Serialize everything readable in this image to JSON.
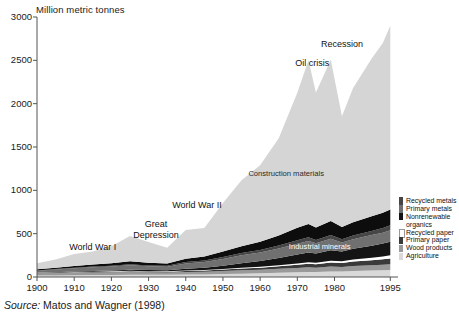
{
  "chart_data": {
    "type": "area",
    "title": "",
    "ylabel": "Million metric tonnes",
    "xlabel": "",
    "ylim": [
      0,
      3000
    ],
    "xlim": [
      1900,
      1996
    ],
    "yticks": [
      0,
      500,
      1000,
      1500,
      2000,
      2500,
      3000
    ],
    "xticks": [
      1900,
      1910,
      1920,
      1930,
      1940,
      1950,
      1960,
      1970,
      1980,
      1995
    ],
    "grid": false,
    "legend_position": "right",
    "stacked": true,
    "stack_order_bottom_to_top": [
      "Agriculture",
      "Wood products",
      "Primary paper",
      "Recycled paper",
      "Nonrenewable organics",
      "Primary metals",
      "Recycled metals",
      "Industrial minerals",
      "Construction materials"
    ],
    "x": [
      1900,
      1905,
      1910,
      1915,
      1920,
      1925,
      1930,
      1935,
      1940,
      1945,
      1950,
      1955,
      1960,
      1965,
      1970,
      1973,
      1975,
      1979,
      1982,
      1985,
      1990,
      1993,
      1995
    ],
    "series": [
      {
        "name": "Agriculture",
        "color": "#d9d9d9",
        "values": [
          16,
          18,
          20,
          22,
          24,
          26,
          26,
          26,
          28,
          30,
          34,
          38,
          42,
          48,
          54,
          58,
          58,
          64,
          64,
          68,
          74,
          78,
          82
        ]
      },
      {
        "name": "Wood products",
        "color": "#9a9a9a",
        "values": [
          26,
          28,
          30,
          30,
          30,
          32,
          28,
          26,
          30,
          32,
          36,
          40,
          42,
          46,
          50,
          54,
          50,
          56,
          52,
          58,
          62,
          64,
          66
        ]
      },
      {
        "name": "Primary paper",
        "color": "#3a3a3a",
        "values": [
          4,
          5,
          6,
          7,
          8,
          9,
          9,
          9,
          11,
          12,
          16,
          20,
          24,
          30,
          38,
          42,
          40,
          48,
          46,
          52,
          58,
          62,
          66
        ]
      },
      {
        "name": "Recycled paper",
        "color": "#ffffff",
        "values": [
          2,
          2,
          3,
          3,
          4,
          4,
          4,
          4,
          5,
          6,
          7,
          8,
          10,
          12,
          15,
          17,
          16,
          20,
          20,
          23,
          28,
          32,
          36
        ]
      },
      {
        "name": "Nonrenewable organics",
        "color": "#141414",
        "values": [
          2,
          3,
          4,
          6,
          9,
          13,
          14,
          14,
          20,
          26,
          38,
          52,
          66,
          84,
          104,
          112,
          106,
          122,
          112,
          124,
          140,
          150,
          158
        ]
      },
      {
        "name": "Primary metals",
        "color": "#707070",
        "values": [
          22,
          30,
          38,
          44,
          46,
          52,
          42,
          40,
          62,
          66,
          78,
          92,
          98,
          110,
          124,
          132,
          118,
          130,
          104,
          112,
          122,
          126,
          132
        ]
      },
      {
        "name": "Recycled metals",
        "color": "#464646",
        "values": [
          4,
          5,
          7,
          9,
          10,
          12,
          10,
          10,
          16,
          18,
          22,
          26,
          30,
          34,
          40,
          44,
          40,
          46,
          38,
          42,
          48,
          52,
          56
        ]
      },
      {
        "name": "Industrial minerals",
        "color": "#0d0d0d",
        "values": [
          12,
          16,
          20,
          24,
          28,
          34,
          30,
          28,
          40,
          46,
          62,
          80,
          96,
          116,
          142,
          152,
          142,
          160,
          140,
          152,
          168,
          176,
          184
        ]
      },
      {
        "name": "Construction materials",
        "color": "#d5d5d5",
        "values": [
          72,
          96,
          136,
          150,
          196,
          290,
          240,
          180,
          330,
          330,
          560,
          760,
          880,
          1120,
          1560,
          1890,
          1560,
          1860,
          1280,
          1550,
          1820,
          1960,
          2120
        ]
      }
    ],
    "annotations": [
      {
        "text": "World War I",
        "x": 1915,
        "y": 330
      },
      {
        "text": "Great\nDepression",
        "x": 1932,
        "y": 600
      },
      {
        "text": "World War II",
        "x": 1943,
        "y": 820
      },
      {
        "text": "Oil crisis",
        "x": 1974,
        "y": 2460
      },
      {
        "text": "Recession",
        "x": 1982,
        "y": 2680
      },
      {
        "text": "Construction materials",
        "x": 1967,
        "y": 1180,
        "inside": true
      },
      {
        "text": "Industrial minerals",
        "x": 1976,
        "y": 330,
        "inside": true,
        "on_dark": true
      }
    ]
  },
  "legend": {
    "items": [
      {
        "label": "Recycled metals",
        "color": "#464646"
      },
      {
        "label": "Primary metals",
        "color": "#707070"
      },
      {
        "label": "Nonrenewable",
        "color": "#141414"
      },
      {
        "label": "organics",
        "color": "#141414",
        "continuation": true
      },
      {
        "label": "Recycled paper",
        "color": "#ffffff"
      },
      {
        "label": "Primary paper",
        "color": "#3a3a3a"
      },
      {
        "label": "Wood products",
        "color": "#9a9a9a"
      },
      {
        "label": "Agriculture",
        "color": "#d9d9d9"
      }
    ]
  },
  "source": {
    "prefix": "Source:",
    "text": "Matos and Wagner (1998)"
  }
}
